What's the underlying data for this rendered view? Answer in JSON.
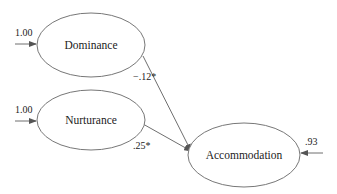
{
  "diagram": {
    "type": "path-model",
    "nodes": [
      {
        "id": "dominance",
        "label": "Dominance",
        "cx": 91,
        "cy": 45,
        "rx": 54,
        "ry": 32
      },
      {
        "id": "nurturance",
        "label": "Nurturance",
        "cx": 91,
        "cy": 120,
        "rx": 54,
        "ry": 30
      },
      {
        "id": "accommodation",
        "label": "Accommodation",
        "cx": 244,
        "cy": 155,
        "rx": 56,
        "ry": 32
      }
    ],
    "edges": [
      {
        "from": "dominance",
        "to": "accommodation",
        "coefficient": "−.12*"
      },
      {
        "from": "nurturance",
        "to": "accommodation",
        "coefficient": ".25*"
      }
    ],
    "external_inputs": [
      {
        "to": "dominance",
        "value": "1.00"
      },
      {
        "to": "nurturance",
        "value": "1.00"
      },
      {
        "to": "accommodation",
        "value": ".93"
      }
    ]
  },
  "labels": {
    "dominance": "Dominance",
    "nurturance": "Nurturance",
    "accommodation": "Accommodation",
    "dominance_input": "1.00",
    "nurturance_input": "1.00",
    "accommodation_error": ".93",
    "dominance_path": "−.12*",
    "nurturance_path": ".25*"
  },
  "colors": {
    "stroke": "#777777",
    "text": "#222222",
    "background": "#ffffff"
  }
}
